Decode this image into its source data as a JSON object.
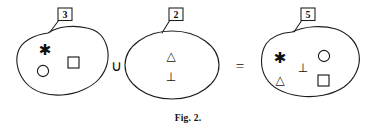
{
  "figure": {
    "caption": "Fig. 2.",
    "operators": {
      "union": "∪",
      "equals": "="
    },
    "symbols": {
      "asterisk": "✱",
      "triangle": "△",
      "uptack": "⊥",
      "circle": "○",
      "square": "□"
    },
    "colors": {
      "ink": "#1c1c1c",
      "paper": "#ffffff"
    },
    "sets": [
      {
        "name": "left-set",
        "label": "3",
        "count": 3,
        "members": [
          "asterisk",
          "square",
          "circle"
        ]
      },
      {
        "name": "middle-set",
        "label": "2",
        "count": 2,
        "members": [
          "triangle",
          "uptack"
        ]
      },
      {
        "name": "right-set",
        "label": "5",
        "count": 5,
        "members": [
          "asterisk",
          "circle",
          "uptack",
          "triangle",
          "square"
        ]
      }
    ]
  }
}
